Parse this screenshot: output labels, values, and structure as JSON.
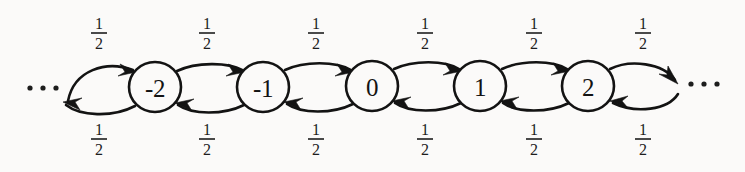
{
  "figure": {
    "kind": "markov-chain-state-diagram",
    "background_color": "#fbfaf9",
    "stroke_color": "#131313",
    "nodes": [
      {
        "id": "n-2",
        "label": "-2",
        "cx": 155,
        "cy": 87,
        "rx": 26,
        "ry": 25
      },
      {
        "id": "n-1",
        "label": "-1",
        "cx": 263,
        "cy": 87,
        "rx": 26,
        "ry": 25
      },
      {
        "id": "n0",
        "label": "0",
        "cx": 372,
        "cy": 86,
        "rx": 26,
        "ry": 25
      },
      {
        "id": "n1",
        "label": "1",
        "cx": 480,
        "cy": 86,
        "rx": 26,
        "ry": 25
      },
      {
        "id": "n2",
        "label": "2",
        "cx": 588,
        "cy": 86,
        "rx": 26,
        "ry": 25
      }
    ],
    "ellipses": [
      {
        "id": "left-ellipsis",
        "text": "...",
        "cx": 43,
        "cy": 88
      },
      {
        "id": "right-ellipsis",
        "text": "...",
        "cx": 704,
        "cy": 84
      }
    ],
    "edge_labels_top": [
      {
        "value": "1/2",
        "numerator": "1",
        "denominator": "2",
        "x": 99,
        "y": 30
      },
      {
        "value": "1/2",
        "numerator": "1",
        "denominator": "2",
        "x": 207,
        "y": 30
      },
      {
        "value": "1/2",
        "numerator": "1",
        "denominator": "2",
        "x": 316,
        "y": 30
      },
      {
        "value": "1/2",
        "numerator": "1",
        "denominator": "2",
        "x": 425,
        "y": 30
      },
      {
        "value": "1/2",
        "numerator": "1",
        "denominator": "2",
        "x": 534,
        "y": 30
      },
      {
        "value": "1/2",
        "numerator": "1",
        "denominator": "2",
        "x": 643,
        "y": 30
      }
    ],
    "edge_labels_bottom": [
      {
        "value": "1/2",
        "numerator": "1",
        "denominator": "2",
        "x": 99,
        "y": 136
      },
      {
        "value": "1/2",
        "numerator": "1",
        "denominator": "2",
        "x": 207,
        "y": 136
      },
      {
        "value": "1/2",
        "numerator": "1",
        "denominator": "2",
        "x": 316,
        "y": 136
      },
      {
        "value": "1/2",
        "numerator": "1",
        "denominator": "2",
        "x": 425,
        "y": 136
      },
      {
        "value": "1/2",
        "numerator": "1",
        "denominator": "2",
        "x": 534,
        "y": 136
      },
      {
        "value": "1/2",
        "numerator": "1",
        "denominator": "2",
        "x": 643,
        "y": 136
      }
    ],
    "transitions": [
      {
        "from": "...",
        "to": "-2",
        "probability": "1/2",
        "direction": "right"
      },
      {
        "from": "-2",
        "to": "-1",
        "probability": "1/2",
        "direction": "right"
      },
      {
        "from": "-1",
        "to": "0",
        "probability": "1/2",
        "direction": "right"
      },
      {
        "from": "0",
        "to": "1",
        "probability": "1/2",
        "direction": "right"
      },
      {
        "from": "1",
        "to": "2",
        "probability": "1/2",
        "direction": "right"
      },
      {
        "from": "2",
        "to": "...",
        "probability": "1/2",
        "direction": "right"
      },
      {
        "from": "-2",
        "to": "...",
        "probability": "1/2",
        "direction": "left"
      },
      {
        "from": "-1",
        "to": "-2",
        "probability": "1/2",
        "direction": "left"
      },
      {
        "from": "0",
        "to": "-1",
        "probability": "1/2",
        "direction": "left"
      },
      {
        "from": "1",
        "to": "0",
        "probability": "1/2",
        "direction": "left"
      },
      {
        "from": "2",
        "to": "1",
        "probability": "1/2",
        "direction": "left"
      },
      {
        "from": "...",
        "to": "2",
        "probability": "1/2",
        "direction": "left"
      }
    ]
  }
}
